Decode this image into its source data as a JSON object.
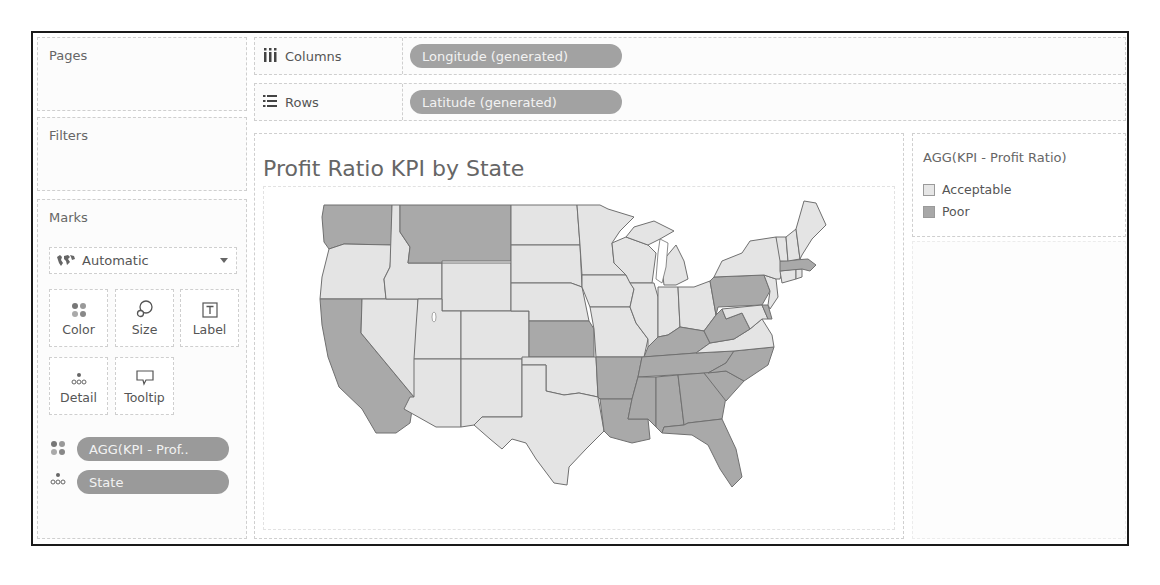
{
  "cards": {
    "pages": {
      "title": "Pages"
    },
    "filters": {
      "title": "Filters"
    },
    "marks": {
      "title": "Marks",
      "mark_type": "Automatic",
      "mark_type_icon": "map-icon",
      "buttons": [
        {
          "label": "Color",
          "icon": "color-dots-icon"
        },
        {
          "label": "Size",
          "icon": "size-circles-icon"
        },
        {
          "label": "Label",
          "icon": "text-label-icon"
        },
        {
          "label": "Detail",
          "icon": "detail-dots-icon"
        },
        {
          "label": "Tooltip",
          "icon": "speech-bubble-icon"
        }
      ],
      "fields": [
        {
          "label": "AGG(KPI - Prof..",
          "encoding": "color"
        },
        {
          "label": "State",
          "encoding": "detail"
        }
      ]
    }
  },
  "shelves": {
    "columns": {
      "label": "Columns",
      "icon": "columns-icon",
      "pill": "Longitude (generated)"
    },
    "rows": {
      "label": "Rows",
      "icon": "rows-icon",
      "pill": "Latitude (generated)"
    }
  },
  "view": {
    "title": "Profit Ratio KPI by State"
  },
  "legend": {
    "title": "AGG(KPI - Profit Ratio)",
    "items": [
      {
        "label": "Acceptable",
        "color": "#e6e6e6"
      },
      {
        "label": "Poor",
        "color": "#a8a8a8"
      }
    ]
  },
  "colors": {
    "acceptable": "#e4e4e4",
    "poor": "#a9a9a9",
    "state_border": "#6e6e6e",
    "pill": "#9a9a9a"
  },
  "map": {
    "type": "filled-choropleth",
    "region": "Contiguous United States",
    "poor_states": [
      "Washington",
      "Montana",
      "California",
      "Kansas",
      "Arkansas",
      "Louisiana",
      "Mississippi",
      "Alabama",
      "Georgia",
      "Florida",
      "Tennessee",
      "Kentucky",
      "South Carolina",
      "North Carolina",
      "West Virginia",
      "Pennsylvania",
      "Massachusetts",
      "Delaware"
    ],
    "acceptable_states": [
      "Oregon",
      "Idaho",
      "Nevada",
      "Utah",
      "Arizona",
      "Wyoming",
      "Colorado",
      "New Mexico",
      "North Dakota",
      "South Dakota",
      "Nebraska",
      "Oklahoma",
      "Texas",
      "Minnesota",
      "Iowa",
      "Missouri",
      "Wisconsin",
      "Illinois",
      "Michigan",
      "Indiana",
      "Ohio",
      "Virginia",
      "Maryland",
      "New Jersey",
      "New York",
      "Connecticut",
      "Rhode Island",
      "Vermont",
      "New Hampshire",
      "Maine"
    ]
  }
}
